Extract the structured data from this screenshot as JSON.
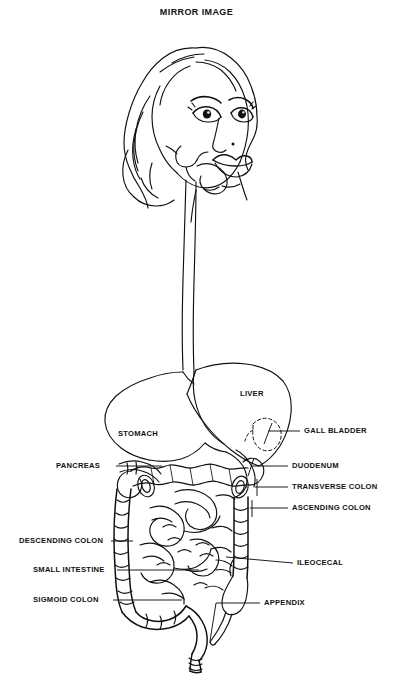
{
  "document": {
    "title": "MIRROR IMAGE",
    "type": "anatomical-line-drawing",
    "subject": "human digestive system",
    "background_color": "#ffffff",
    "line_color": "#000000"
  },
  "labels": {
    "liver": "LIVER",
    "stomach": "STOMACH",
    "gall_bladder": "GALL BLADDER",
    "duodenum": "DUODENUM",
    "transverse_colon": "TRANSVERSE COLON",
    "ascending_colon": "ASCENDING COLON",
    "ileocecal": "ILEOCECAL",
    "appendix": "APPENDIX",
    "pancreas": "PANCREAS",
    "descending_colon": "DESCENDING COLON",
    "small_intestine": "SMALL INTESTINE",
    "sigmoid_colon": "SIGMOID COLON"
  },
  "label_list": [
    {
      "name": "LIVER",
      "side": "inner",
      "x": 240,
      "y": 390
    },
    {
      "name": "STOMACH",
      "side": "inner",
      "x": 118,
      "y": 430
    },
    {
      "name": "GALL BLADDER",
      "side": "right",
      "x": 304,
      "y": 427
    },
    {
      "name": "DUODENUM",
      "side": "right",
      "x": 292,
      "y": 462
    },
    {
      "name": "TRANSVERSE COLON",
      "side": "right",
      "x": 292,
      "y": 483
    },
    {
      "name": "ASCENDING COLON",
      "side": "right",
      "x": 292,
      "y": 504
    },
    {
      "name": "ILEOCECAL",
      "side": "right",
      "x": 297,
      "y": 559
    },
    {
      "name": "APPENDIX",
      "side": "right",
      "x": 264,
      "y": 599
    },
    {
      "name": "PANCREAS",
      "side": "left",
      "x": 56,
      "y": 462
    },
    {
      "name": "DESCENDING COLON",
      "side": "left",
      "x": 19,
      "y": 537
    },
    {
      "name": "SMALL INTESTINE",
      "side": "left",
      "x": 33,
      "y": 566
    },
    {
      "name": "SIGMOID COLON",
      "side": "left",
      "x": 33,
      "y": 596
    }
  ]
}
